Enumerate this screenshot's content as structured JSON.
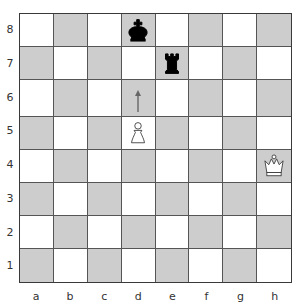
{
  "board": {
    "files": [
      "a",
      "b",
      "c",
      "d",
      "e",
      "f",
      "g",
      "h"
    ],
    "ranks": [
      "8",
      "7",
      "6",
      "5",
      "4",
      "3",
      "2",
      "1"
    ],
    "colors": {
      "light_square": "#ffffff",
      "dark_square": "#cdcdcd",
      "white_piece_fill": "#ffffff",
      "black_piece_fill": "#000000"
    },
    "pieces": [
      {
        "square": "d8",
        "color": "black",
        "type": "king"
      },
      {
        "square": "e7",
        "color": "black",
        "type": "rook"
      },
      {
        "square": "d5",
        "color": "white",
        "type": "pawn"
      },
      {
        "square": "h4",
        "color": "white",
        "type": "queen"
      }
    ],
    "annotations": [
      {
        "square": "d6",
        "type": "arrow-up",
        "meaning": "pawn advance indicator"
      }
    ]
  }
}
